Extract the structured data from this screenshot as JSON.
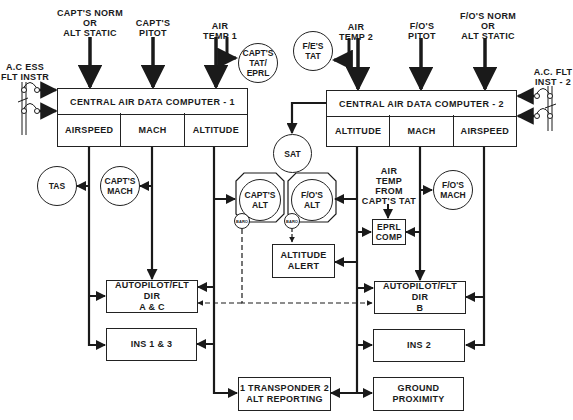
{
  "diagram": {
    "inputs": {
      "capt_static": "CAPT'S NORM\nOR\nALT STATIC",
      "capt_pitot": "CAPT'S\nPITOT",
      "air_temp_1": "AIR\nTEMP 1",
      "air_temp_2": "AIR\nTEMP 2",
      "fo_pitot": "F/O'S\nPITOT",
      "fo_static": "F/O'S NORM\nOR\nALT STATIC",
      "ac_ess_flt_instr": "A.C ESS\nFLT INSTR",
      "ac_flt_inst_2": "A.C. FLT\nINST - 2",
      "air_temp_from_capt_tat": "AIR\nTEMP\nFROM\nCAPT'S TAT"
    },
    "cadc1": {
      "title": "CENTRAL AIR DATA COMPUTER - 1",
      "cells": [
        "AIRSPEED",
        "MACH",
        "ALTITUDE"
      ]
    },
    "cadc2": {
      "title": "CENTRAL AIR DATA COMPUTER - 2",
      "cells": [
        "ALTITUDE",
        "MACH",
        "AIRSPEED"
      ]
    },
    "indicators": {
      "capt_tat_eprl": "CAPT'S\nTAT/\nEPRL",
      "fe_tat": "F/E'S\nTAT",
      "sat": "SAT",
      "tas": "TAS",
      "capt_mach": "CAPT'S\nMACH",
      "capt_alt": "CAPT'S\nALT",
      "fo_alt": "F/O'S\nALT",
      "fo_mach": "F/O'S\nMACH",
      "baro": "BARO"
    },
    "boxes": {
      "altitude_alert": "ALTITUDE\nALERT",
      "eprl_comp": "EPRL\nCOMP",
      "autopilot_ac": "AUTOPILOT/FLT DIR\nA & C",
      "ins_1_3": "INS 1 & 3",
      "autopilot_b": "AUTOPILOT/FLT DIR\nB",
      "ins_2": "INS 2",
      "transponder": "1 TRANSPONDER 2\nALT REPORTING",
      "ground_proximity": "GROUND\nPROXIMITY"
    },
    "colors": {
      "line": "#1a1a1a",
      "background": "#ffffff"
    }
  }
}
